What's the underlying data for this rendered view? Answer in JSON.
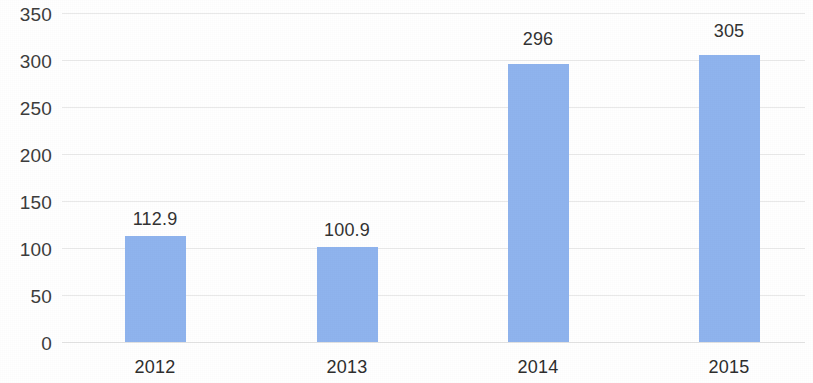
{
  "chart_data": {
    "type": "bar",
    "title": "",
    "subtitle": "",
    "xlabel": "",
    "ylabel": "",
    "categories": [
      "2012",
      "2013",
      "2014",
      "2015"
    ],
    "values": [
      112.9,
      100.9,
      296,
      305
    ],
    "value_labels": [
      "112.9",
      "100.9",
      "296",
      "305"
    ],
    "ylim": [
      0,
      350
    ],
    "ytick_labels": [
      "0",
      "50",
      "100",
      "150",
      "200",
      "250",
      "300",
      "350"
    ],
    "ytick_values": [
      0,
      50,
      100,
      150,
      200,
      250,
      300,
      350
    ],
    "grid": "horizontal",
    "legend": "none",
    "series": [
      {
        "name": "",
        "values": [
          112.9,
          100.9,
          296,
          305
        ],
        "color": "#8fb4ee"
      }
    ],
    "colors": {
      "bar": "#8fb4ee",
      "gridline": "#e9e9e9",
      "axis_text": "#333333",
      "background": "#ffffff"
    }
  }
}
